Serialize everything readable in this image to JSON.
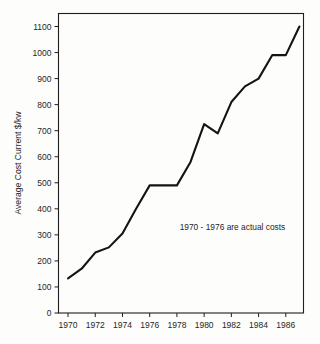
{
  "chart_data": {
    "type": "line",
    "title": "",
    "xlabel": "",
    "ylabel": "Average Cost Current $/kw",
    "xlim": [
      1969.3,
      1987.3
    ],
    "ylim": [
      0,
      1150
    ],
    "grid": false,
    "legend": null,
    "annotations": [
      {
        "text": "1970 - 1976 are actual costs",
        "x": 1978.2,
        "y": 320
      }
    ],
    "x_tick_labels": [
      "1970",
      "1972",
      "1974",
      "1976",
      "1978",
      "1980",
      "1982",
      "1984",
      "1986"
    ],
    "x_ticks": [
      1970,
      1972,
      1974,
      1976,
      1978,
      1980,
      1982,
      1984,
      1986
    ],
    "y_tick_labels": [
      "0",
      "100",
      "200",
      "300",
      "400",
      "500",
      "600",
      "700",
      "800",
      "900",
      "1000",
      "1100"
    ],
    "y_ticks": [
      0,
      100,
      200,
      300,
      400,
      500,
      600,
      700,
      800,
      900,
      1000,
      1100
    ],
    "x": [
      1970,
      1971,
      1972,
      1973,
      1974,
      1975,
      1976,
      1977,
      1978,
      1979,
      1980,
      1981,
      1982,
      1983,
      1984,
      1985,
      1986,
      1987
    ],
    "values": [
      133,
      170,
      232,
      252,
      305,
      400,
      490,
      490,
      490,
      580,
      725,
      690,
      810,
      870,
      900,
      990,
      990,
      1100
    ],
    "series": [
      {
        "name": "Average Cost Current $/kw",
        "color": "#141414",
        "values": [
          133,
          170,
          232,
          252,
          305,
          400,
          490,
          490,
          490,
          580,
          725,
          690,
          810,
          870,
          900,
          990,
          990,
          1100
        ]
      }
    ]
  },
  "colors": {
    "line": "#141414",
    "axis": "#1e1e1e",
    "text": "#262626",
    "background": "#fdfdfc"
  }
}
